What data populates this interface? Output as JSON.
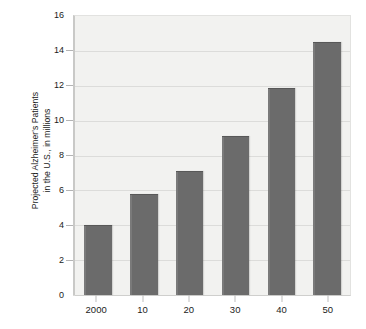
{
  "chart_data": {
    "type": "bar",
    "title": "",
    "subtitle": "",
    "xlabel": "",
    "ylabel": "Projected Alzheimer's Patients in the U.S., in millions",
    "ylabel_lines": [
      "Projected Alzheimer's Patients",
      "in the U.S., in millions"
    ],
    "categories": [
      "2000",
      "10",
      "20",
      "30",
      "40",
      "50"
    ],
    "values": [
      4.0,
      5.8,
      7.1,
      9.1,
      11.9,
      14.5
    ],
    "series": [
      {
        "name": "Projected Alzheimer's Patients",
        "values": [
          4.0,
          5.8,
          7.1,
          9.1,
          11.9,
          14.5
        ]
      }
    ],
    "ylim": [
      0,
      16
    ],
    "xlim_categories": 6,
    "y_ticks": [
      0,
      2,
      4,
      6,
      8,
      10,
      12,
      14,
      16
    ],
    "y_tick_labels": [
      "0",
      "2",
      "4",
      "6",
      "8",
      "10",
      "12",
      "14",
      "16"
    ],
    "grid": true,
    "grid_axis": "y",
    "legend": false,
    "legend_position": "none",
    "bar_color": "#6b6b6b",
    "plot_background": "#f2f2f0",
    "figure_background": "#ffffff",
    "gridline_color": "#dcdcda",
    "axis_color": "#c9c9c7",
    "text_color": "#1b1b1b"
  }
}
